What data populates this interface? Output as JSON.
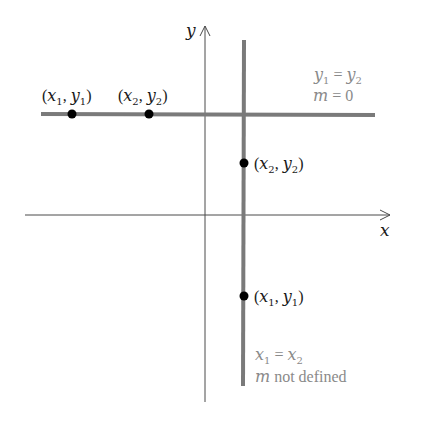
{
  "figure": {
    "axes": {
      "x_label": "x",
      "y_label": "y"
    },
    "horizontal_line": {
      "point1": {
        "open": "(",
        "x": "x",
        "x_sub": "1",
        "sep": ", ",
        "y": "y",
        "y_sub": "1",
        "close": ")"
      },
      "point2": {
        "open": "(",
        "x": "x",
        "x_sub": "2",
        "sep": ", ",
        "y": "y",
        "y_sub": "2",
        "close": ")"
      },
      "condition": {
        "lhs": "y",
        "lhs_sub": "1",
        "eq": " = ",
        "rhs": "y",
        "rhs_sub": "2"
      },
      "slope": {
        "m": "m",
        "eq": " = ",
        "value": "0"
      }
    },
    "vertical_line": {
      "point2": {
        "open": "(",
        "x": "x",
        "x_sub": "2",
        "sep": ", ",
        "y": "y",
        "y_sub": "2",
        "close": ")"
      },
      "point1": {
        "open": "(",
        "x": "x",
        "x_sub": "1",
        "sep": ", ",
        "y": "y",
        "y_sub": "1",
        "close": ")"
      },
      "condition": {
        "lhs": "x",
        "lhs_sub": "1",
        "eq": " = ",
        "rhs": "x",
        "rhs_sub": "2"
      },
      "slope": {
        "m": "m",
        "text": " not defined"
      }
    },
    "colors": {
      "axis": "#4a4a4a",
      "thick_line": "#7a7a7a",
      "point": "#000000",
      "label_dark": "#1a1a1a",
      "label_gray": "#8a8a8a"
    }
  }
}
